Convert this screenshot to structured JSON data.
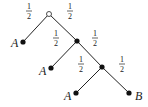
{
  "diagram": {
    "type": "probability-tree",
    "root": {
      "x": 49,
      "y": 14,
      "style": "open"
    },
    "nodes": [
      {
        "id": "n1",
        "x": 23,
        "y": 42,
        "label": "A",
        "label_x": 11,
        "label_y": 47
      },
      {
        "id": "n2",
        "x": 77,
        "y": 41,
        "label": "",
        "label_x": 0,
        "label_y": 0
      },
      {
        "id": "n3",
        "x": 51,
        "y": 68,
        "label": "A",
        "label_x": 39,
        "label_y": 75
      },
      {
        "id": "n4",
        "x": 102,
        "y": 67,
        "label": "",
        "label_x": 0,
        "label_y": 0
      },
      {
        "id": "n5",
        "x": 76,
        "y": 93,
        "label": "A",
        "label_x": 64,
        "label_y": 100
      },
      {
        "id": "n6",
        "x": 129,
        "y": 93,
        "label": "B",
        "label_x": 135,
        "label_y": 100
      }
    ],
    "edges": [
      {
        "from": "root",
        "to": "n1",
        "prob_num": "1",
        "prob_den": "2",
        "px": 29,
        "py": 11
      },
      {
        "from": "root",
        "to": "n2",
        "prob_num": "1",
        "prob_den": "2",
        "px": 70,
        "py": 11
      },
      {
        "from": "n2",
        "to": "n3",
        "prob_num": "1",
        "prob_den": "2",
        "px": 56,
        "py": 38
      },
      {
        "from": "n2",
        "to": "n4",
        "prob_num": "1",
        "prob_den": "2",
        "px": 95,
        "py": 38
      },
      {
        "from": "n4",
        "to": "n5",
        "prob_num": "1",
        "prob_den": "2",
        "px": 81,
        "py": 64
      },
      {
        "from": "n4",
        "to": "n6",
        "prob_num": "1",
        "prob_den": "2",
        "px": 122,
        "py": 64
      }
    ]
  }
}
